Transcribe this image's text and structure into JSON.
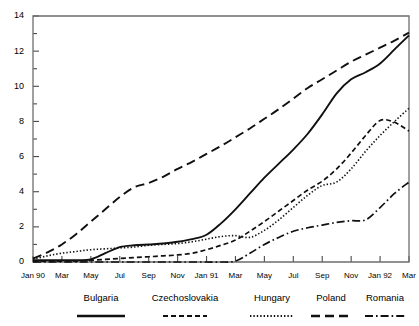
{
  "chart_data": {
    "type": "line",
    "title": "",
    "subtitle": "",
    "xlabel": "",
    "ylabel": "",
    "ylim": [
      0,
      14
    ],
    "yticks": [
      0,
      2,
      4,
      6,
      8,
      10,
      12,
      14
    ],
    "yticks_minor": [
      1,
      3,
      5,
      7,
      9,
      11,
      13
    ],
    "grid": false,
    "legend_position": "bottom",
    "x": [
      "Jan 90",
      "Feb 90",
      "Mar 90",
      "Apr 90",
      "May 90",
      "Jun 90",
      "Jul 90",
      "Aug 90",
      "Sep 90",
      "Oct 90",
      "Nov 90",
      "Dec 90",
      "Jan 91",
      "Feb 91",
      "Mar 91",
      "Apr 91",
      "May 91",
      "Jun 91",
      "Jul 91",
      "Aug 91",
      "Sep 91",
      "Oct 91",
      "Nov 91",
      "Dec 91",
      "Jan 92",
      "Feb 92",
      "Mar 92"
    ],
    "xtick_labels": [
      "Jan 90",
      "Mar",
      "May",
      "Jul",
      "Sep",
      "Nov",
      "Jan 91",
      "Mar",
      "May",
      "Jul",
      "Sep",
      "Nov",
      "Jan 92",
      "Mar"
    ],
    "xtick_label_indices": [
      0,
      2,
      4,
      6,
      8,
      10,
      12,
      14,
      16,
      18,
      20,
      22,
      24,
      26
    ],
    "series": [
      {
        "name": "Bulgaria",
        "style": "solid",
        "values": [
          0.1,
          0.1,
          0.1,
          0.1,
          0.15,
          0.5,
          0.85,
          0.95,
          1.0,
          1.05,
          1.15,
          1.3,
          1.55,
          2.2,
          3.0,
          3.9,
          4.8,
          5.6,
          6.4,
          7.3,
          8.4,
          9.6,
          10.4,
          10.8,
          11.3,
          12.1,
          12.9
        ]
      },
      {
        "name": "Czechoslovakia",
        "style": "short-dash",
        "values": [
          0.05,
          0.05,
          0.05,
          0.05,
          0.1,
          0.15,
          0.2,
          0.25,
          0.3,
          0.35,
          0.4,
          0.5,
          0.7,
          0.95,
          1.25,
          1.75,
          2.3,
          2.9,
          3.5,
          4.1,
          4.6,
          5.3,
          6.2,
          7.2,
          8.05,
          7.95,
          7.45
        ]
      },
      {
        "name": "Hungary",
        "style": "dotted",
        "values": [
          0.15,
          0.35,
          0.5,
          0.6,
          0.7,
          0.75,
          0.8,
          0.85,
          0.95,
          1.0,
          1.05,
          1.15,
          1.3,
          1.45,
          1.5,
          1.4,
          1.8,
          2.4,
          3.1,
          3.8,
          4.35,
          4.55,
          5.3,
          6.3,
          7.2,
          8.0,
          8.75
        ]
      },
      {
        "name": "Poland",
        "style": "long-dash",
        "values": [
          0.2,
          0.55,
          1.0,
          1.6,
          2.3,
          3.0,
          3.7,
          4.25,
          4.5,
          4.85,
          5.3,
          5.7,
          6.15,
          6.6,
          7.1,
          7.6,
          8.15,
          8.7,
          9.3,
          9.9,
          10.4,
          10.9,
          11.4,
          11.8,
          12.2,
          12.6,
          13.05
        ]
      },
      {
        "name": "Romania",
        "style": "dash-dot",
        "values": [
          0.0,
          0.0,
          0.0,
          0.0,
          0.0,
          0.0,
          0.0,
          0.0,
          0.0,
          0.0,
          0.0,
          0.0,
          0.0,
          0.0,
          0.05,
          0.5,
          1.0,
          1.4,
          1.75,
          1.95,
          2.1,
          2.25,
          2.35,
          2.4,
          3.1,
          3.9,
          4.55
        ]
      }
    ]
  },
  "legend": {
    "items": [
      {
        "label": "Bulgaria",
        "style": "solid"
      },
      {
        "label": "Czechoslovakia",
        "style": "short-dash"
      },
      {
        "label": "Hungary",
        "style": "dotted"
      },
      {
        "label": "Poland",
        "style": "long-dash"
      },
      {
        "label": "Romania",
        "style": "dash-dot"
      }
    ]
  },
  "colors": {
    "ink": "#101010",
    "axis": "#6e6e6e",
    "background": "#ffffff"
  }
}
